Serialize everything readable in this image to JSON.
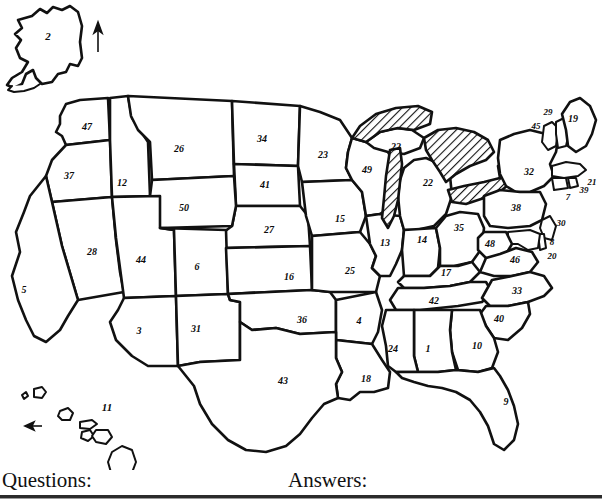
{
  "document": {
    "type": "worksheet",
    "title": "Numbered United States Map",
    "description": "Blank outline map of the United States with each state marked by a number from 1 to 50"
  },
  "footer": {
    "questions_label": "Questions:",
    "answers_label": "Answers:"
  },
  "map": {
    "north_arrow": "north-arrow-icon",
    "hawaii_arrow": "west-pointing-arrow-icon",
    "great_lakes_fill": "diagonal-hatch",
    "outline_color": "#111111",
    "background_color": "#ffffff"
  },
  "state_numbers": [
    {
      "num": "2",
      "x": 48,
      "y": 36,
      "size": "lg"
    },
    {
      "num": "47",
      "x": 87,
      "y": 127,
      "size": "md"
    },
    {
      "num": "37",
      "x": 69,
      "y": 176,
      "size": "md"
    },
    {
      "num": "12",
      "x": 122,
      "y": 183,
      "size": "md"
    },
    {
      "num": "26",
      "x": 179,
      "y": 149,
      "size": "md"
    },
    {
      "num": "34",
      "x": 262,
      "y": 139,
      "size": "md"
    },
    {
      "num": "23",
      "x": 323,
      "y": 155,
      "size": "md"
    },
    {
      "num": "41",
      "x": 265,
      "y": 185,
      "size": "md"
    },
    {
      "num": "50",
      "x": 184,
      "y": 208,
      "size": "md"
    },
    {
      "num": "27",
      "x": 269,
      "y": 230,
      "size": "md"
    },
    {
      "num": "15",
      "x": 340,
      "y": 219,
      "size": "md"
    },
    {
      "num": "49",
      "x": 367,
      "y": 170,
      "size": "md"
    },
    {
      "num": "22",
      "x": 396,
      "y": 147,
      "size": "md"
    },
    {
      "num": "22",
      "x": 428,
      "y": 183,
      "size": "md"
    },
    {
      "num": "28",
      "x": 92,
      "y": 252,
      "size": "md"
    },
    {
      "num": "5",
      "x": 24,
      "y": 290,
      "size": "md"
    },
    {
      "num": "44",
      "x": 141,
      "y": 260,
      "size": "md"
    },
    {
      "num": "6",
      "x": 197,
      "y": 267,
      "size": "md"
    },
    {
      "num": "16",
      "x": 289,
      "y": 277,
      "size": "md"
    },
    {
      "num": "25",
      "x": 350,
      "y": 271,
      "size": "md"
    },
    {
      "num": "13",
      "x": 385,
      "y": 243,
      "size": "md"
    },
    {
      "num": "14",
      "x": 422,
      "y": 240,
      "size": "md"
    },
    {
      "num": "35",
      "x": 459,
      "y": 228,
      "size": "md"
    },
    {
      "num": "32",
      "x": 529,
      "y": 172,
      "size": "md"
    },
    {
      "num": "38",
      "x": 516,
      "y": 208,
      "size": "md"
    },
    {
      "num": "45",
      "x": 536,
      "y": 126,
      "size": "sm"
    },
    {
      "num": "29",
      "x": 548,
      "y": 112,
      "size": "sm"
    },
    {
      "num": "19",
      "x": 573,
      "y": 119,
      "size": "md"
    },
    {
      "num": "21",
      "x": 592,
      "y": 182,
      "size": "sm"
    },
    {
      "num": "39",
      "x": 584,
      "y": 190,
      "size": "sm"
    },
    {
      "num": "7",
      "x": 568,
      "y": 197,
      "size": "sm"
    },
    {
      "num": "30",
      "x": 561,
      "y": 223,
      "size": "sm"
    },
    {
      "num": "8",
      "x": 552,
      "y": 242,
      "size": "sm"
    },
    {
      "num": "20",
      "x": 552,
      "y": 256,
      "size": "sm"
    },
    {
      "num": "3",
      "x": 139,
      "y": 331,
      "size": "md"
    },
    {
      "num": "31",
      "x": 196,
      "y": 329,
      "size": "md"
    },
    {
      "num": "36",
      "x": 302,
      "y": 320,
      "size": "md"
    },
    {
      "num": "4",
      "x": 359,
      "y": 321,
      "size": "md"
    },
    {
      "num": "17",
      "x": 446,
      "y": 273,
      "size": "md"
    },
    {
      "num": "48",
      "x": 490,
      "y": 244,
      "size": "md"
    },
    {
      "num": "46",
      "x": 515,
      "y": 260,
      "size": "md"
    },
    {
      "num": "33",
      "x": 517,
      "y": 291,
      "size": "md"
    },
    {
      "num": "42",
      "x": 434,
      "y": 301,
      "size": "md"
    },
    {
      "num": "40",
      "x": 499,
      "y": 319,
      "size": "md"
    },
    {
      "num": "24",
      "x": 393,
      "y": 349,
      "size": "md"
    },
    {
      "num": "1",
      "x": 428,
      "y": 349,
      "size": "md"
    },
    {
      "num": "10",
      "x": 477,
      "y": 346,
      "size": "md"
    },
    {
      "num": "18",
      "x": 366,
      "y": 379,
      "size": "md"
    },
    {
      "num": "43",
      "x": 283,
      "y": 381,
      "size": "md"
    },
    {
      "num": "9",
      "x": 506,
      "y": 402,
      "size": "md"
    },
    {
      "num": "11",
      "x": 107,
      "y": 407,
      "size": "lg"
    }
  ]
}
